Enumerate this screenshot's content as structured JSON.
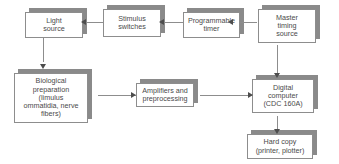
{
  "diagram": {
    "type": "flowchart",
    "background_color": "#ffffff",
    "box_border_color": "#8d8d8d",
    "box_shadow_color": "#8a8a8a",
    "connector_color": "#8d8d8d",
    "arrowhead_color": "#4d4d4d",
    "text_color": "#4a4a4a",
    "nodes": [
      {
        "id": "light-source",
        "label": "Light\nsource"
      },
      {
        "id": "stimulus-switches",
        "label": "Stimulus\nswitches"
      },
      {
        "id": "programmable-timer",
        "label": "Programmable\ntimer"
      },
      {
        "id": "master-timing-source",
        "label": "Master\ntiming\nsource"
      },
      {
        "id": "biological-preparation",
        "label": "Biological\npreparation\n(limulus\nommatidia, nerve\nfibers)"
      },
      {
        "id": "amplifiers-preprocessing",
        "label": "Amplifiers and\npreprocessing"
      },
      {
        "id": "digital-computer",
        "label": "Digital\ncomputer\n(CDC 160A)"
      },
      {
        "id": "hard-copy",
        "label": "Hard copy\n(printer, plotter)"
      }
    ],
    "edges": [
      {
        "id": "master-to-timer",
        "from": "master-timing-source",
        "to": "programmable-timer",
        "direction": "left"
      },
      {
        "id": "timer-to-switches",
        "from": "programmable-timer",
        "to": "stimulus-switches",
        "direction": "left"
      },
      {
        "id": "switches-to-light",
        "from": "stimulus-switches",
        "to": "light-source",
        "direction": "left"
      },
      {
        "id": "light-to-biological",
        "from": "light-source",
        "to": "biological-preparation",
        "direction": "down"
      },
      {
        "id": "biological-to-amps",
        "from": "biological-preparation",
        "to": "amplifiers-preprocessing",
        "direction": "right"
      },
      {
        "id": "amps-to-computer",
        "from": "amplifiers-preprocessing",
        "to": "digital-computer",
        "direction": "right"
      },
      {
        "id": "master-to-computer",
        "from": "master-timing-source",
        "to": "digital-computer",
        "direction": "down"
      },
      {
        "id": "computer-to-hardcopy",
        "from": "digital-computer",
        "to": "hard-copy",
        "direction": "down"
      }
    ]
  }
}
